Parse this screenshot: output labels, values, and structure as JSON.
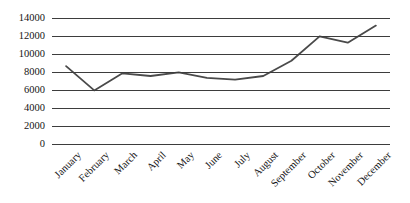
{
  "chart_data": {
    "type": "line",
    "title": "",
    "xlabel": "",
    "ylabel": "",
    "categories": [
      "January",
      "February",
      "March",
      "April",
      "May",
      "June",
      "July",
      "August",
      "September",
      "October",
      "November",
      "December"
    ],
    "values": [
      8600,
      5900,
      7800,
      7500,
      7900,
      7300,
      7100,
      7500,
      9200,
      11900,
      11200,
      13100
    ],
    "series": [
      {
        "name": "",
        "values": [
          8600,
          5900,
          7800,
          7500,
          7900,
          7300,
          7100,
          7500,
          9200,
          11900,
          11200,
          13100
        ]
      }
    ],
    "ylim": [
      0,
      14000
    ],
    "yticks": [
      0,
      2000,
      4000,
      6000,
      8000,
      10000,
      12000,
      14000
    ],
    "ytick_labels": [
      "0",
      "2000",
      "4000",
      "6000",
      "8000",
      "10000",
      "12000",
      "14000"
    ],
    "grid": true,
    "legend": false,
    "legend_position": "none",
    "line_color": "#4a4a4a",
    "grid_color": "#3d3d3d",
    "background_color": "#ffffff",
    "xtick_rotation": -45
  }
}
